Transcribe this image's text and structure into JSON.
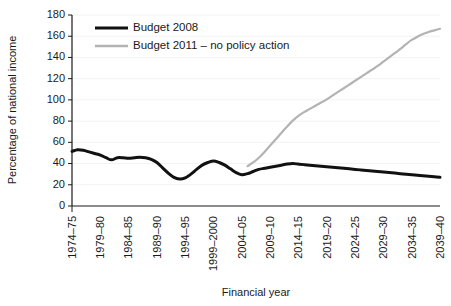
{
  "chart_data": {
    "type": "line",
    "title": "",
    "xlabel": "Financial year",
    "ylabel": "Percentage of national income",
    "ylim": [
      0,
      180
    ],
    "yticks": [
      0,
      20,
      40,
      60,
      80,
      100,
      120,
      140,
      160,
      180
    ],
    "grid": true,
    "legend_position": "top-center",
    "x_tick_labels": [
      "1974–75",
      "1979–80",
      "1984–85",
      "1989–90",
      "1994–95",
      "1999–2000",
      "2004–05",
      "2009–10",
      "2014–15",
      "2019–20",
      "2024–25",
      "2029–30",
      "2034–35",
      "2039–40"
    ],
    "x_tick_years": [
      1974,
      1979,
      1984,
      1989,
      1994,
      1999,
      2004,
      2009,
      2014,
      2019,
      2024,
      2029,
      2034,
      2039
    ],
    "x_range_years": [
      1974,
      2039
    ],
    "series": [
      {
        "name": "Budget 2008",
        "color": "#111111",
        "width": 3.0,
        "x": [
          1974,
          1975,
          1976,
          1977,
          1978,
          1979,
          1980,
          1981,
          1982,
          1983,
          1984,
          1985,
          1986,
          1987,
          1988,
          1989,
          1990,
          1991,
          1992,
          1993,
          1994,
          1995,
          1996,
          1997,
          1998,
          1999,
          2000,
          2001,
          2002,
          2003,
          2004,
          2005,
          2006,
          2007,
          2008,
          2009,
          2010,
          2011,
          2012,
          2013,
          2014,
          2015,
          2016,
          2017,
          2018,
          2019,
          2020,
          2021,
          2022,
          2023,
          2024,
          2025,
          2026,
          2027,
          2028,
          2029,
          2030,
          2031,
          2032,
          2033,
          2034,
          2035,
          2036,
          2037,
          2038,
          2039
        ],
        "values": [
          51.5,
          53.0,
          52.5,
          51.0,
          49.5,
          48.0,
          45.5,
          43.5,
          45.5,
          45.5,
          45.0,
          45.5,
          46.0,
          45.5,
          44.0,
          41.0,
          36.0,
          31.0,
          27.0,
          25.5,
          26.5,
          30.0,
          34.5,
          38.5,
          41.0,
          42.5,
          41.0,
          38.5,
          35.0,
          31.5,
          29.5,
          30.5,
          32.5,
          34.5,
          35.5,
          36.5,
          37.5,
          38.5,
          39.5,
          40.0,
          39.5,
          39.0,
          38.5,
          38.0,
          37.5,
          37.0,
          36.5,
          36.0,
          35.5,
          35.0,
          34.5,
          34.0,
          33.5,
          33.0,
          32.5,
          32.0,
          31.5,
          31.0,
          30.5,
          30.0,
          29.5,
          29.0,
          28.5,
          28.0,
          27.5,
          27.0
        ]
      },
      {
        "name": "Budget 2011 – no policy action",
        "color": "#b3b3b3",
        "width": 2.2,
        "x": [
          2005,
          2006,
          2007,
          2008,
          2009,
          2010,
          2011,
          2012,
          2013,
          2014,
          2015,
          2016,
          2017,
          2018,
          2019,
          2020,
          2021,
          2022,
          2023,
          2024,
          2025,
          2026,
          2027,
          2028,
          2029,
          2030,
          2031,
          2032,
          2033,
          2034,
          2035,
          2036,
          2037,
          2038,
          2039
        ],
        "values": [
          37.5,
          41.0,
          45.5,
          51.0,
          57.0,
          63.0,
          69.0,
          75.0,
          80.5,
          85.0,
          88.5,
          91.5,
          94.5,
          97.5,
          100.5,
          104.0,
          107.5,
          111.0,
          114.5,
          118.0,
          121.5,
          125.0,
          128.5,
          132.0,
          136.0,
          140.0,
          144.0,
          148.0,
          152.5,
          156.5,
          159.5,
          162.0,
          164.0,
          165.5,
          167.0
        ]
      }
    ],
    "legend": [
      {
        "label": "Budget 2008",
        "color": "#111111",
        "width": 3.0
      },
      {
        "label": "Budget 2011 – no policy action",
        "color": "#b3b3b3",
        "width": 2.6
      }
    ]
  },
  "geometry": {
    "plot_left": 72,
    "plot_right": 440,
    "plot_top": 15,
    "plot_bottom": 206,
    "minor_tick_step_years": 1,
    "tick_length": 4,
    "legend_x_swatch_start": 95,
    "legend_x_swatch_end": 128,
    "legend_text_x": 133,
    "legend_row_1_y": 28,
    "legend_row_2_y": 46,
    "ylabel_x": 16,
    "ylabel_y": 110,
    "xlabel_x": 256,
    "xlabel_y": 296
  }
}
